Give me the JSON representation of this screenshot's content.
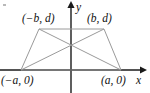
{
  "figure": {
    "axes": {
      "x_label": "x",
      "y_label": "y",
      "x_axis_color": "#1a1a1a",
      "y_axis_color": "#1a1a1a",
      "origin": {
        "x": 71,
        "y": 70
      }
    },
    "shape": {
      "kind": "trapezoid",
      "stroke_color": "#9a9a9a",
      "fill": "none",
      "vertices": [
        {
          "label": "(−a, 0)",
          "px": 21,
          "py": 70
        },
        {
          "label": "(a, 0)",
          "px": 121,
          "py": 70
        },
        {
          "label": "(b, d)",
          "px": 104,
          "py": 29
        },
        {
          "label": "(−b, d)",
          "px": 39,
          "py": 29
        }
      ],
      "diagonals": [
        {
          "from": "(−a, 0)",
          "to": "(b, d)"
        },
        {
          "from": "(a, 0)",
          "to": "(−b, d)"
        }
      ],
      "diagonal_intersection": {
        "px": 71,
        "py": 48
      }
    },
    "labels": {
      "top_left": "(−b, d)",
      "top_right": "(b, d)",
      "bottom_left": "(−a, 0)",
      "bottom_right": "(a, 0)",
      "y_axis": "y",
      "x_axis": "x"
    }
  }
}
